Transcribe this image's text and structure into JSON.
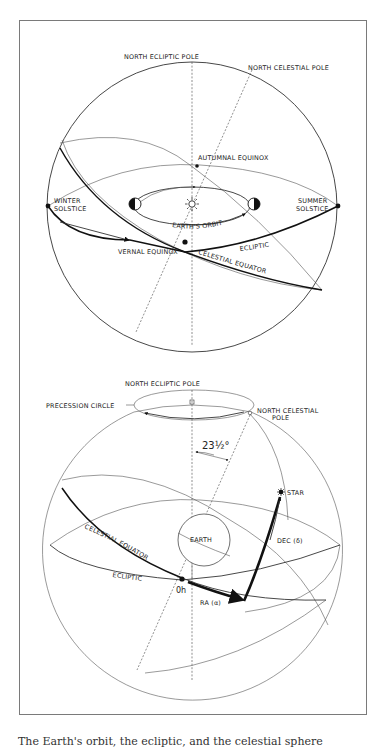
{
  "figure": {
    "top_diagram": {
      "labels": {
        "north_ecliptic_pole": "NORTH ECLIPTIC POLE",
        "north_celestial_pole": "NORTH CELESTIAL POLE",
        "autumnal_equinox": "AUTUMNAL EQUINOX",
        "winter_solstice_1": "WINTER",
        "winter_solstice_2": "SOLSTICE",
        "summer_solstice_1": "SUMMER",
        "summer_solstice_2": "SOLSTICE",
        "earths_orbit": "EARTH'S ORBIT",
        "ecliptic": "ECLIPTIC",
        "vernal_equinox": "VERNAL EQUINOX",
        "celestial_equator": "CELESTIAL EQUATOR"
      }
    },
    "bottom_diagram": {
      "labels": {
        "north_ecliptic_pole": "NORTH ECLIPTIC POLE",
        "precession_circle": "PRECESSION CIRCLE",
        "north_celestial_pole_1": "NORTH CELESTIAL",
        "north_celestial_pole_2": "POLE",
        "angle": "23½°",
        "star": "STAR",
        "earth": "EARTH",
        "declination": "DEC (δ)",
        "celestial_equator": "CELESTIAL EQUATOR",
        "ecliptic": "ECLIPTIC",
        "zero_hour": "0h",
        "right_ascension": "RA (α)"
      }
    },
    "caption": "The Earth's orbit, the ecliptic, and the celestial sphere"
  },
  "colors": {
    "line": "#222222",
    "frame": "#7a7a7a",
    "background": "#ffffff"
  }
}
